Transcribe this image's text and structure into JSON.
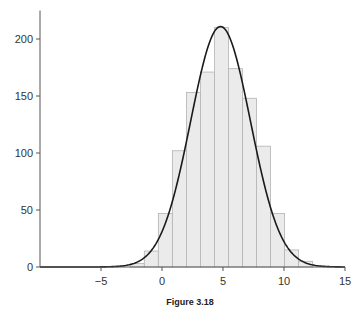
{
  "caption": "Figure 3.18",
  "colors": {
    "bar_fill": "#ebebeb",
    "bar_stroke": "#b3b3b3",
    "curve": "#1a1a1a",
    "axis": "#555555"
  },
  "chart_data": {
    "type": "bar",
    "subtype": "histogram-with-density-curve",
    "title": "",
    "xlabel": "",
    "ylabel": "",
    "xlim": [
      -10,
      15
    ],
    "ylim": [
      0,
      225
    ],
    "x_ticks": [
      -5,
      0,
      5,
      10,
      15
    ],
    "x_tick_labels": [
      "−5",
      "0",
      "5",
      "10",
      "15"
    ],
    "y_ticks": [
      0,
      50,
      100,
      150,
      200
    ],
    "y_tick_labels": [
      "0",
      "50",
      "100",
      "150",
      "200"
    ],
    "grid": false,
    "legend": null,
    "bin_edges": [
      -2.6,
      -1.45,
      -0.3,
      0.85,
      2.0,
      3.15,
      4.3,
      5.45,
      6.6,
      7.75,
      8.9,
      10.05,
      11.2,
      12.35
    ],
    "counts": [
      3,
      14,
      47,
      102,
      153,
      171,
      210,
      174,
      148,
      106,
      47,
      15,
      5
    ],
    "series": [
      {
        "name": "histogram",
        "type": "bar",
        "values": [
          3,
          14,
          47,
          102,
          153,
          171,
          210,
          174,
          148,
          106,
          47,
          15,
          5
        ]
      },
      {
        "name": "normal density fit",
        "type": "line",
        "mean": 4.8,
        "sd": 2.45,
        "peak": 211
      }
    ]
  }
}
